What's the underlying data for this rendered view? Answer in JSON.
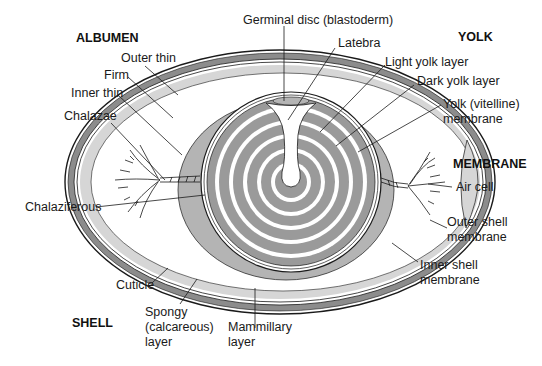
{
  "diagram": {
    "colors": {
      "shell_dark": "#8c8c8c",
      "shell_light": "#d6d6d6",
      "albumen_firm": "#ffffff",
      "chalaziferous": "#b4b4b4",
      "dark_yolk": "#9a9a9a",
      "light_yolk": "#ffffff",
      "outline": "#1a1a1a"
    },
    "section_headers": {
      "albumen": "ALBUMEN",
      "yolk": "YOLK",
      "membrane": "MEMBRANE",
      "shell": "SHELL"
    },
    "labels": {
      "outer_thin": "Outer thin",
      "firm": "Firm",
      "inner_thin": "Inner thin",
      "chalazae": "Chalazae",
      "chalaziferous": "Chalaziferous",
      "germinal_disc": "Germinal disc (blastoderm)",
      "latebra": "Latebra",
      "light_yolk_layer": "Light yolk layer",
      "dark_yolk_layer": "Dark yolk layer",
      "yolk_membrane_line1": "Yolk (vitelline)",
      "yolk_membrane_line2": "membrane",
      "air_cell": "Air cell",
      "outer_shell_membrane_line1": "Outer shell",
      "outer_shell_membrane_line2": "membrane",
      "inner_shell_membrane_line1": "Inner shell",
      "inner_shell_membrane_line2": "membrane",
      "cuticle": "Cuticle",
      "spongy_line1": "Spongy",
      "spongy_line2": "(calcareous)",
      "spongy_line3": "layer",
      "mammillary_line1": "Mammillary",
      "mammillary_line2": "layer"
    }
  }
}
